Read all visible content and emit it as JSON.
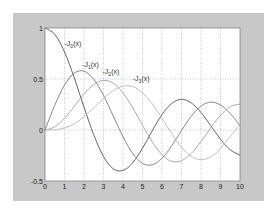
{
  "chart_data": {
    "type": "line",
    "title": "",
    "xlabel": "",
    "ylabel": "",
    "xlim": [
      0,
      10
    ],
    "ylim": [
      -0.5,
      1
    ],
    "grid": true,
    "x_ticks": [
      "0",
      "1",
      "2",
      "3",
      "4",
      "5",
      "6",
      "7",
      "8",
      "9",
      "10"
    ],
    "y_ticks": [
      "-0.5",
      "0",
      "0.5",
      "1"
    ],
    "x": [
      0,
      0.5,
      1,
      1.5,
      2,
      2.5,
      3,
      3.5,
      4,
      4.5,
      5,
      5.5,
      6,
      6.5,
      7,
      7.5,
      8,
      8.5,
      9,
      9.5,
      10
    ],
    "series": [
      {
        "name": "J0(x)",
        "color": "#555555",
        "values": [
          1.0,
          0.938,
          0.765,
          0.512,
          0.224,
          -0.048,
          -0.26,
          -0.38,
          -0.397,
          -0.321,
          -0.178,
          -0.007,
          0.151,
          0.26,
          0.3,
          0.266,
          0.172,
          0.042,
          -0.09,
          -0.194,
          -0.246
        ]
      },
      {
        "name": "J1(x)",
        "color": "#7a7a7a",
        "values": [
          0.0,
          0.242,
          0.44,
          0.558,
          0.577,
          0.497,
          0.339,
          0.137,
          -0.066,
          -0.231,
          -0.328,
          -0.341,
          -0.277,
          -0.154,
          -0.005,
          0.135,
          0.235,
          0.273,
          0.245,
          0.161,
          0.043
        ]
      },
      {
        "name": "J2(x)",
        "color": "#a0a0a0",
        "values": [
          0.0,
          0.031,
          0.115,
          0.232,
          0.353,
          0.446,
          0.486,
          0.459,
          0.364,
          0.218,
          0.047,
          -0.117,
          -0.243,
          -0.307,
          -0.301,
          -0.23,
          -0.113,
          0.022,
          0.145,
          0.228,
          0.255
        ]
      },
      {
        "name": "J3(x)",
        "color": "#b8b8b8",
        "values": [
          0.0,
          0.003,
          0.02,
          0.061,
          0.129,
          0.217,
          0.309,
          0.387,
          0.43,
          0.425,
          0.365,
          0.256,
          0.115,
          -0.035,
          -0.168,
          -0.258,
          -0.291,
          -0.262,
          -0.181,
          -0.065,
          0.058
        ]
      }
    ],
    "annotations": [
      {
        "text": "J0(x)",
        "base": "J",
        "sub": "0",
        "x": 1.0,
        "y": 0.82
      },
      {
        "text": "J1(x)",
        "base": "J",
        "sub": "1",
        "x": 1.9,
        "y": 0.62
      },
      {
        "text": "J2(x)",
        "base": "J",
        "sub": "2",
        "x": 2.95,
        "y": 0.55
      },
      {
        "text": "J3(x)",
        "base": "J",
        "sub": "3",
        "x": 4.5,
        "y": 0.48
      }
    ]
  },
  "figure": {
    "background": "#c8c8c8",
    "axes_background": "#ffffff",
    "grid_color": "#888888"
  }
}
